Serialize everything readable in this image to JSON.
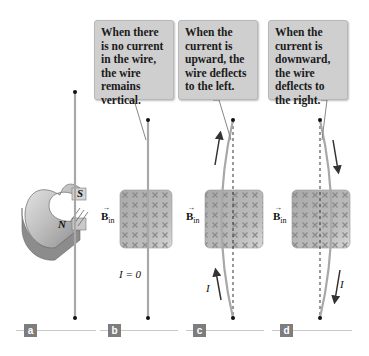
{
  "callouts": [
    {
      "text": "When there is no current in the wire, the wire remains vertical."
    },
    {
      "text": "When the current is upward, the wire deflects to the left."
    },
    {
      "text": "When the current is downward, the wire deflects to the right."
    }
  ],
  "labels": {
    "magnet_south": "S",
    "magnet_north": "N",
    "b_field": "B",
    "b_field_sub": "in",
    "zero_current": "I = 0",
    "current": "I"
  },
  "panels": [
    {
      "tag": "a"
    },
    {
      "tag": "b"
    },
    {
      "tag": "c"
    },
    {
      "tag": "d"
    }
  ],
  "colors": {
    "callout_bg": "#cfcfcf",
    "wire": "#a8a8a8",
    "field_region": "#b5b5b5",
    "field_x": "#8a8a8a",
    "tag_bg": "#7d7d7d"
  }
}
